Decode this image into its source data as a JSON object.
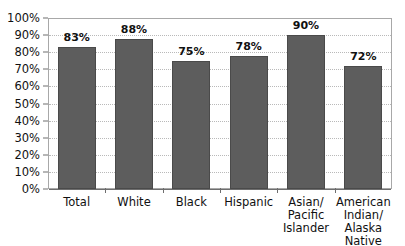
{
  "chart_data": {
    "type": "bar",
    "title": "",
    "subtitle": "",
    "xlabel": "",
    "ylabel": "",
    "categories": [
      "Total",
      "White",
      "Black",
      "Hispanic",
      "Asian/\nPacific\nIslander",
      "American\nIndian/\nAlaska Native"
    ],
    "values": [
      83,
      88,
      75,
      78,
      90,
      72
    ],
    "data_labels": [
      "83%",
      "88%",
      "75%",
      "78%",
      "90%",
      "72%"
    ],
    "ylim": [
      0,
      100
    ],
    "y_tick_values": [
      100,
      90,
      80,
      70,
      60,
      50,
      40,
      30,
      20,
      10,
      0
    ],
    "y_tick_labels": [
      "100%",
      "90%",
      "80%",
      "70%",
      "60%",
      "50%",
      "40%",
      "30%",
      "20%",
      "10%",
      "0%"
    ],
    "grid": true,
    "grid_orientation": "horizontal",
    "legend": false,
    "legend_position": "none",
    "series": [
      {
        "name": "",
        "values": [
          83,
          88,
          75,
          78,
          90,
          72
        ]
      }
    ],
    "colors": {
      "bar_fill": "#5d5d5d",
      "bar_border": "#4a4a4a",
      "gridline": "#b9b9b9",
      "axis_line": "#6e6e6e",
      "plot_border": "#a8a8a8",
      "plot_background": "#ffffff",
      "text": "#111111"
    }
  }
}
